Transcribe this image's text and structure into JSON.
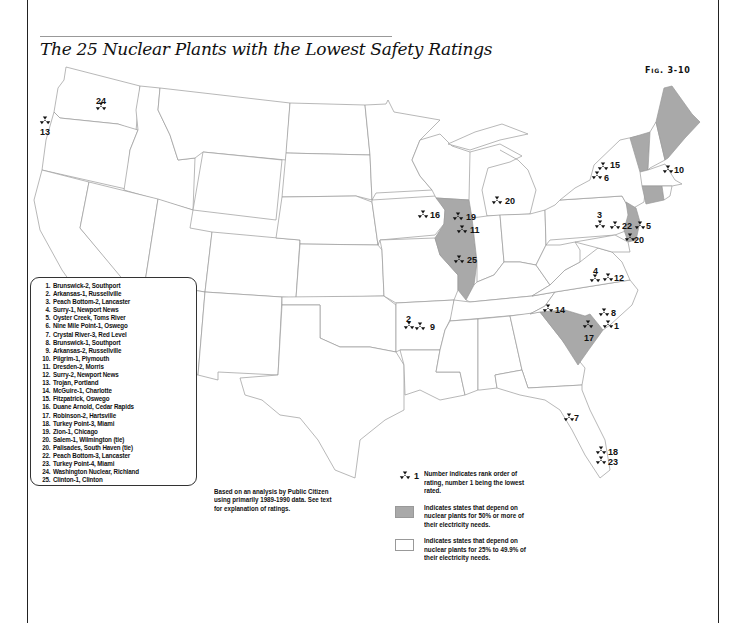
{
  "title": "The 25 Nuclear Plants with the Lowest Safety Ratings",
  "figure_label": "Fig. 3-10",
  "plants": [
    {
      "rank": "1.",
      "name": "Brunswick-2, Southport"
    },
    {
      "rank": "2.",
      "name": "Arkansas-1, Russellville"
    },
    {
      "rank": "3.",
      "name": "Peach Bottom-2, Lancaster"
    },
    {
      "rank": "4.",
      "name": "Surry-1, Newport News"
    },
    {
      "rank": "5.",
      "name": "Oyster Creek, Toms River"
    },
    {
      "rank": "6.",
      "name": "Nine Mile Point-1, Oswego"
    },
    {
      "rank": "7.",
      "name": "Crystal River-3, Red Level"
    },
    {
      "rank": "8.",
      "name": "Brunswick-1, Southport"
    },
    {
      "rank": "9.",
      "name": "Arkansas-2, Russellville"
    },
    {
      "rank": "10.",
      "name": "Pilgrim-1, Plymouth"
    },
    {
      "rank": "11.",
      "name": "Dresden-2, Morris"
    },
    {
      "rank": "12.",
      "name": "Surry-2, Newport News"
    },
    {
      "rank": "13.",
      "name": "Trojan, Portland"
    },
    {
      "rank": "14.",
      "name": "McGuire-1, Charlotte"
    },
    {
      "rank": "15.",
      "name": "Fitzpatrick, Oswego"
    },
    {
      "rank": "16.",
      "name": "Duane Arnold, Cedar Rapids"
    },
    {
      "rank": "17.",
      "name": "Robinson-2, Hartsville"
    },
    {
      "rank": "18.",
      "name": "Turkey Point-3, Miami"
    },
    {
      "rank": "19.",
      "name": "Zion-1, Chicago"
    },
    {
      "rank": "20.",
      "name": "Salem-1, Wilmington (tie)"
    },
    {
      "rank": "20.",
      "name": "Palisades, South Haven (tie)"
    },
    {
      "rank": "22.",
      "name": "Peach Bottom-3, Lancaster"
    },
    {
      "rank": "23.",
      "name": "Turkey Point-4, Miami"
    },
    {
      "rank": "24.",
      "name": "Washington Nuclear, Richland"
    },
    {
      "rank": "25.",
      "name": "Clinton-1, Clinton"
    }
  ],
  "map_markers": [
    {
      "label": "24",
      "x": 101,
      "y": 107,
      "lx": 96,
      "ly": 104,
      "pos": "above"
    },
    {
      "label": "13",
      "x": 45,
      "y": 121,
      "lx": 40,
      "ly": 135,
      "pos": "below"
    },
    {
      "label": "16",
      "x": 423,
      "y": 215,
      "lx": 430,
      "ly": 218,
      "pos": "right"
    },
    {
      "label": "19",
      "x": 458,
      "y": 217,
      "lx": 466,
      "ly": 220,
      "pos": "right"
    },
    {
      "label": "11",
      "x": 462,
      "y": 230,
      "lx": 470,
      "ly": 233,
      "pos": "right"
    },
    {
      "label": "25",
      "x": 459,
      "y": 260,
      "lx": 467,
      "ly": 263,
      "pos": "right"
    },
    {
      "label": "20",
      "x": 497,
      "y": 201,
      "lx": 505,
      "ly": 204,
      "pos": "right"
    },
    {
      "label": "15",
      "x": 603,
      "y": 167,
      "lx": 610,
      "ly": 168,
      "pos": "right"
    },
    {
      "label": "6",
      "x": 597,
      "y": 176,
      "lx": 604,
      "ly": 181,
      "pos": "right"
    },
    {
      "label": "10",
      "x": 668,
      "y": 170,
      "lx": 674,
      "ly": 173,
      "pos": "right"
    },
    {
      "label": "3",
      "x": 600,
      "y": 225,
      "lx": 597,
      "ly": 218,
      "pos": "above"
    },
    {
      "label": "22",
      "x": 615,
      "y": 226,
      "lx": 622,
      "ly": 229,
      "pos": "right"
    },
    {
      "label": "5",
      "x": 640,
      "y": 226,
      "lx": 646,
      "ly": 229,
      "pos": "right"
    },
    {
      "label": "20",
      "x": 630,
      "y": 238,
      "lx": 634,
      "ly": 243,
      "pos": "right"
    },
    {
      "label": "4",
      "x": 595,
      "y": 279,
      "lx": 593,
      "ly": 274,
      "pos": "above"
    },
    {
      "label": "12",
      "x": 608,
      "y": 278,
      "lx": 614,
      "ly": 281,
      "pos": "right"
    },
    {
      "label": "14",
      "x": 548,
      "y": 309,
      "lx": 555,
      "ly": 313,
      "pos": "right"
    },
    {
      "label": "8",
      "x": 604,
      "y": 313,
      "lx": 611,
      "ly": 316,
      "pos": "right"
    },
    {
      "label": "1",
      "x": 608,
      "y": 325,
      "lx": 614,
      "ly": 329,
      "pos": "right"
    },
    {
      "label": "17",
      "x": 588,
      "y": 325,
      "lx": 584,
      "ly": 341,
      "pos": "below"
    },
    {
      "label": "2",
      "x": 409,
      "y": 326,
      "lx": 406,
      "ly": 322,
      "pos": "above"
    },
    {
      "label": "9",
      "x": 420,
      "y": 327,
      "lx": 430,
      "ly": 330,
      "pos": "right"
    },
    {
      "label": "7",
      "x": 569,
      "y": 418,
      "lx": 574,
      "ly": 421,
      "pos": "right"
    },
    {
      "label": "18",
      "x": 601,
      "y": 451,
      "lx": 608,
      "ly": 455,
      "pos": "right"
    },
    {
      "label": "23",
      "x": 601,
      "y": 461,
      "lx": 608,
      "ly": 465,
      "pos": "right"
    }
  ],
  "source_note": "Based on an analysis by Public Citizen using primarily 1989-1990 data. See text for explanation of ratings.",
  "legend": {
    "symbol_example_number": "1",
    "symbol_text": "Number indicates rank order of rating, number 1 being the lowest rated.",
    "gray_text": "Indicates states that depend on nuclear plants for 50% or more of their electricity needs.",
    "white_text": "Indicates states that depend on nuclear plants for 25% to 49.9% of their electricity needs."
  },
  "colors": {
    "high_dependence_fill": "#a9a9a9",
    "state_border": "#9a9a9a",
    "marker": "#111111"
  },
  "high_dependence_states": [
    "Illinois",
    "South Carolina",
    "New Jersey",
    "Vermont",
    "Maine",
    "Connecticut"
  ]
}
